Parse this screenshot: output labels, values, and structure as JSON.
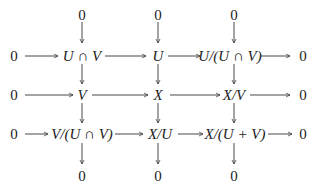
{
  "diagram": {
    "type": "commutative-diagram",
    "top_zeros": [
      "0",
      "0",
      "0"
    ],
    "bottom_zeros": [
      "0",
      "0",
      "0"
    ],
    "rows": [
      {
        "left": "0",
        "cells": [
          "U ∩ V",
          "U",
          "U/(U ∩ V)"
        ],
        "right": "0"
      },
      {
        "left": "0",
        "cells": [
          "V",
          "X",
          "X/V"
        ],
        "right": "0"
      },
      {
        "left": "0",
        "cells": [
          "V/(U ∩ V)",
          "X/U",
          "X/(U + V)"
        ],
        "right": "0"
      }
    ]
  }
}
